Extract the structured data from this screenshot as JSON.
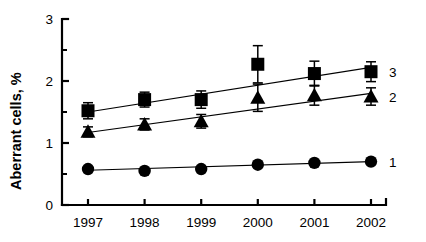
{
  "chart_data": {
    "type": "line",
    "title": "",
    "xlabel": "",
    "ylabel": "Aberrant cells, %",
    "categories": [
      "1997",
      "1998",
      "1999",
      "2000",
      "2001",
      "2002"
    ],
    "x": [
      1997,
      1998,
      1999,
      2000,
      2001,
      2002
    ],
    "xlim": [
      1996.5,
      2002.5
    ],
    "ylim": [
      0,
      3
    ],
    "y_major_ticks": [
      "0",
      "1",
      "2",
      "3"
    ],
    "y_major_tick_values": [
      0,
      1,
      2,
      3
    ],
    "y_minor_tick_values": [
      0.5,
      1.5,
      2.5
    ],
    "grid": false,
    "legend_position": "right-inline",
    "error_bar_style": "symmetric-with-caps",
    "series": [
      {
        "name": "3",
        "label": "3",
        "marker": "square",
        "color": "#000000",
        "values": [
          1.52,
          1.7,
          1.7,
          2.27,
          2.12,
          2.15
        ],
        "errors": [
          0.13,
          0.12,
          0.14,
          0.3,
          0.2,
          0.16
        ],
        "trendline": {
          "start": 1.5,
          "end": 2.22
        }
      },
      {
        "name": "2",
        "label": "2",
        "marker": "triangle",
        "color": "#000000",
        "values": [
          1.18,
          1.3,
          1.35,
          1.73,
          1.77,
          1.75
        ],
        "errors": [
          0.08,
          0.09,
          0.11,
          0.22,
          0.16,
          0.14
        ],
        "trendline": {
          "start": 1.17,
          "end": 1.8
        }
      },
      {
        "name": "1",
        "label": "1",
        "marker": "circle",
        "color": "#000000",
        "values": [
          0.58,
          0.55,
          0.58,
          0.65,
          0.68,
          0.7
        ],
        "errors": [
          0.0,
          0.0,
          0.0,
          0.0,
          0.0,
          0.0
        ],
        "trendline": {
          "start": 0.56,
          "end": 0.7
        }
      }
    ]
  },
  "figure": {
    "background_color": "#ffffff",
    "axis_color": "#000000",
    "ylabel": "Aberrant cells, %"
  }
}
